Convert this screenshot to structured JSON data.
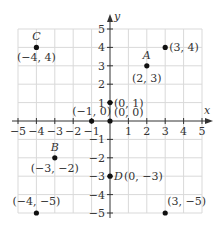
{
  "chart_data": {
    "type": "scatter",
    "title": "",
    "xlabel": "x",
    "ylabel": "y",
    "xlim": [
      -5,
      5
    ],
    "ylim": [
      -5,
      5
    ],
    "grid": true,
    "x_ticks": [
      "−5",
      "−4",
      "−3",
      "−2",
      "−1",
      "1",
      "2",
      "3",
      "4",
      "5"
    ],
    "y_ticks": [
      "5",
      "4",
      "3",
      "2",
      "1",
      "−1",
      "−2",
      "−3",
      "−4",
      "−5"
    ],
    "points": [
      {
        "name": "C",
        "x": -4,
        "y": 4,
        "label": "(−4, 4)"
      },
      {
        "name": "A",
        "x": 2,
        "y": 3,
        "label": "(2, 3)"
      },
      {
        "name": "",
        "x": 3,
        "y": 4,
        "label": "(3, 4)"
      },
      {
        "name": "",
        "x": 0,
        "y": 1,
        "label": "(0, 1)"
      },
      {
        "name": "",
        "x": 0,
        "y": 0,
        "label": "(0, 0)"
      },
      {
        "name": "",
        "x": -1,
        "y": 0,
        "label": "(−1, 0)"
      },
      {
        "name": "B",
        "x": -3,
        "y": -2,
        "label": "(−3, −2)"
      },
      {
        "name": "D",
        "x": 0,
        "y": -3,
        "label": "(0, −3)"
      },
      {
        "name": "",
        "x": -4,
        "y": -5,
        "label": "(−4, −5)"
      },
      {
        "name": "",
        "x": 3,
        "y": -5,
        "label": "(3, −5)"
      }
    ]
  },
  "colors": {
    "grid": "#d9d9d9",
    "axis": "#333333",
    "point": "#111111"
  }
}
